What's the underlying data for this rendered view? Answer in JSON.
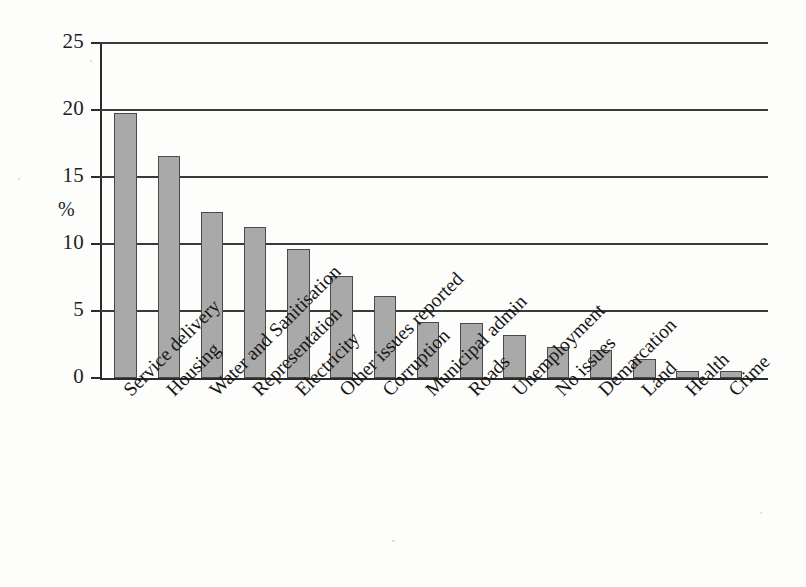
{
  "chart_data": {
    "type": "bar",
    "title": "",
    "xlabel": "",
    "ylabel": "%",
    "ylim": [
      0,
      25
    ],
    "yticks": [
      0,
      5,
      10,
      15,
      20,
      25
    ],
    "ytick_labels": [
      "0",
      "5",
      "10",
      "15",
      "20",
      "25"
    ],
    "grid": true,
    "grid_axis": "y",
    "legend": false,
    "legend_position": "none",
    "bar_color": "#a9a9a9",
    "bar_edge_color": "#4a4a4a",
    "axis_color": "#2b2b2b",
    "background_color": "#fdfdfc",
    "categories": [
      "Service delivery",
      "Housing",
      "Water and Sanitisation",
      "Representation",
      "Electricity",
      "Other issues reported",
      "Corruption",
      "Municipal admin",
      "Roads",
      "Unemployment",
      "No issues",
      "Demarcation",
      "Land",
      "Health",
      "Crime"
    ],
    "values": [
      19.8,
      16.6,
      12.4,
      11.3,
      9.6,
      7.6,
      6.1,
      4.2,
      4.1,
      3.2,
      2.3,
      2.1,
      1.4,
      0.5,
      0.5
    ]
  }
}
